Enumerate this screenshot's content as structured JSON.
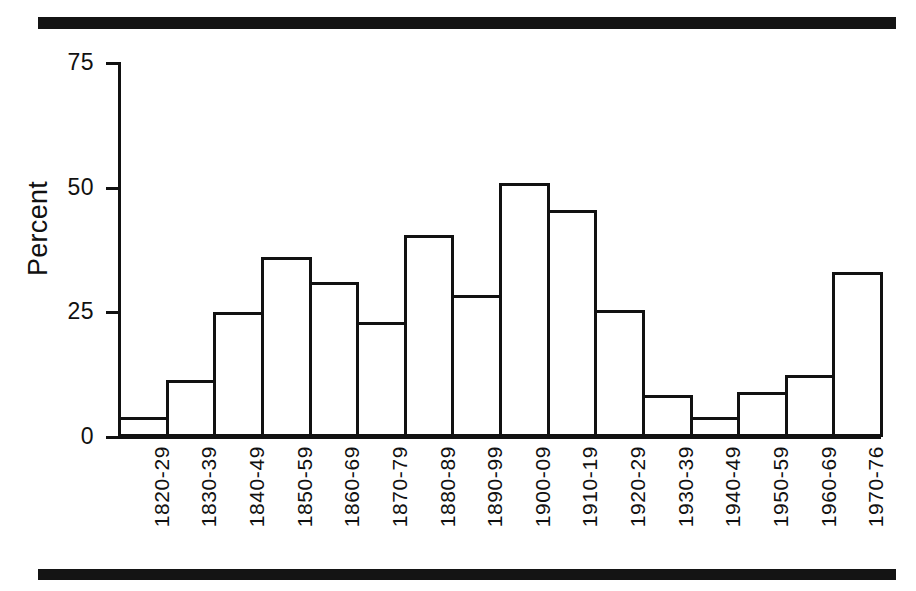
{
  "figure": {
    "background_color": "#ffffff",
    "ink_color": "#111111",
    "rule_color": "#141414"
  },
  "chart_data": {
    "type": "bar",
    "title": "",
    "subtitle": "",
    "xlabel": "",
    "ylabel": "Percent",
    "ylim": [
      0,
      75
    ],
    "yticks": [
      0,
      25,
      50,
      75
    ],
    "ytick_labels": [
      "0",
      "25",
      "50",
      "75"
    ],
    "grid": false,
    "legend": false,
    "legend_position": "none",
    "bar_style": "outlined-white-fill",
    "categories": [
      "1820-29",
      "1830-39",
      "1840-49",
      "1850-59",
      "1860-69",
      "1870-79",
      "1880-89",
      "1890-99",
      "1900-09",
      "1910-19",
      "1920-29",
      "1930-39",
      "1940-49",
      "1950-59",
      "1960-69",
      "1970-76"
    ],
    "values": [
      4,
      11.5,
      25,
      36,
      31,
      23,
      40.5,
      28.5,
      51,
      45.5,
      25.5,
      8.5,
      4,
      9,
      12.5,
      33
    ],
    "xtick_label_rotation": 90,
    "annotations": []
  }
}
